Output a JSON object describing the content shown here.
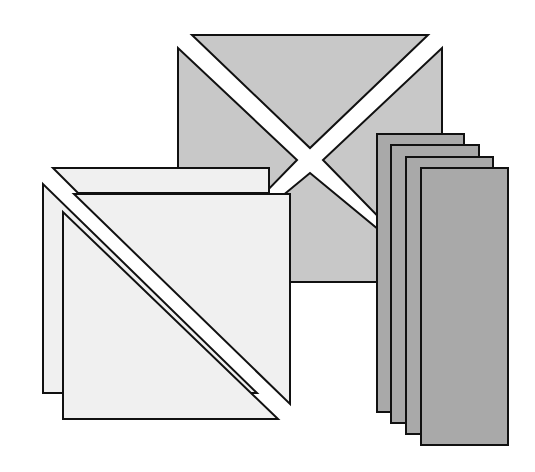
{
  "diagram": {
    "background": "#ffffff",
    "stroke_color": "#111111",
    "fills": {
      "pale": "#f0f0f0",
      "light_gray": "#c8c8c8",
      "dark_gray": "#a9a9a9"
    },
    "groups": [
      {
        "name": "split-square-cross",
        "description": "Square split into four triangles by both diagonals, separated by white gaps",
        "fill": "light_gray",
        "triangles": [
          {
            "name": "top",
            "points": "192,35 428,35 310,148"
          },
          {
            "name": "left",
            "points": "178,48 178,282 297,160"
          },
          {
            "name": "right",
            "points": "442,48 442,282 323,160"
          },
          {
            "name": "bottom",
            "points": "178,282 442,282 310,173"
          }
        ]
      },
      {
        "name": "split-squares-diagonal",
        "description": "Two offset squares each split along one diagonal into two triangles",
        "fill": "pale",
        "triangles": [
          {
            "name": "back-upper",
            "points": "53,168 269,168 269,193 260,193 "
          },
          {
            "name": "back-lower",
            "points": "43,184 43,393 257,393"
          },
          {
            "name": "front-upper",
            "points": "74,194 290,194 290,404"
          },
          {
            "name": "front-lower",
            "points": "63,212 63,419 278,419"
          }
        ]
      },
      {
        "name": "stacked-rectangles",
        "description": "Four tall rectangles stacked with diagonal offset",
        "fill": "dark_gray",
        "rects": [
          {
            "x": 377,
            "y": 134,
            "w": 87,
            "h": 278
          },
          {
            "x": 391,
            "y": 145,
            "w": 88,
            "h": 278
          },
          {
            "x": 406,
            "y": 157,
            "w": 87,
            "h": 277
          },
          {
            "x": 421,
            "y": 168,
            "w": 87,
            "h": 277
          }
        ]
      }
    ]
  }
}
